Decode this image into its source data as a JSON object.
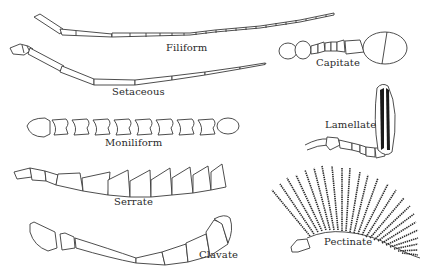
{
  "figure": {
    "background": "#ffffff",
    "ink_color": "#2a2a2a"
  },
  "labels": {
    "filiform": "Filiform",
    "setaceous": "Setaceous",
    "capitate": "Capitate",
    "moniliform": "Moniliform",
    "lamellate": "Lamellate",
    "serrate": "Serrate",
    "clavate": "Clavate",
    "pectinate": "Pectinate"
  }
}
